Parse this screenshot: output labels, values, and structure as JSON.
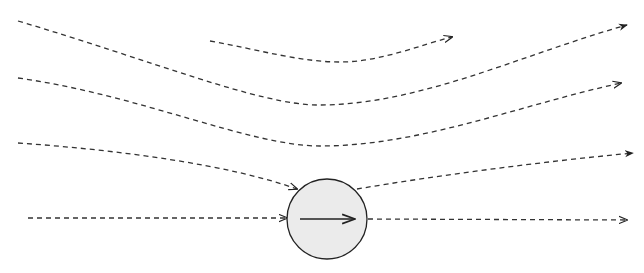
{
  "diagram": {
    "title": "",
    "colors": {
      "background": "#ffffff",
      "streamline": "#333333",
      "sphere_fill": "#ebebeb",
      "sphere_stroke": "#222222",
      "velocity_arrow": "#222222"
    },
    "sphere": {
      "cx": 327,
      "cy": 219,
      "r": 40
    },
    "velocity_arrow": {
      "x1": 300,
      "y1": 219,
      "x2": 355,
      "y2": 219
    },
    "streamlines": [
      {
        "id": "streamline-1",
        "path": "M18,21 C150,60 260,105 318,105 C420,105 520,55 627,25",
        "arrow": "filled"
      },
      {
        "id": "streamline-short",
        "path": "M210,41 C260,50 300,62 340,62 C380,62 420,45 452,37",
        "arrow": "open"
      },
      {
        "id": "streamline-2",
        "path": "M18,78 C140,95 250,146 320,146 C420,146 520,105 621,83",
        "arrow": "open"
      },
      {
        "id": "streamline-3-in",
        "path": "M18,143 C120,150 230,165 297,189",
        "arrow": "open"
      },
      {
        "id": "streamline-3-out",
        "path": "M357,189 C440,175 540,162 633,153",
        "arrow": "filled"
      },
      {
        "id": "streamline-4-in",
        "path": "M28,218 L287,218",
        "arrow": "open"
      },
      {
        "id": "streamline-4-out",
        "path": "M368,219 L627,220",
        "arrow": "open"
      }
    ]
  }
}
